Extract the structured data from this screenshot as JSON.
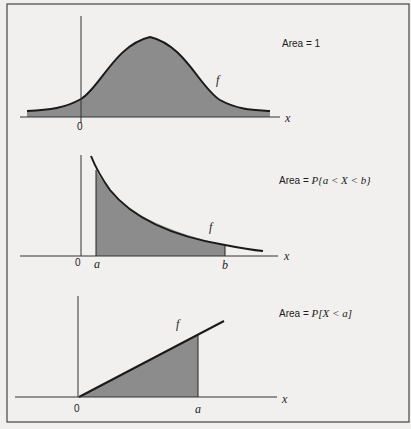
{
  "figure": {
    "colors": {
      "background": "#f1f0ee",
      "line": "#1a1a1a",
      "shade": "#8c8c8c",
      "frame": "#444444"
    },
    "panels": [
      {
        "id": "normal",
        "curve_type": "bell",
        "area_label": "Area = 1",
        "function_label": "f",
        "axis_label": "x",
        "origin_label": "0",
        "shaded_region": "entire area under curve"
      },
      {
        "id": "exponential",
        "curve_type": "decreasing",
        "area_label_prefix": "Area = ",
        "area_label_expr": "P{a < X < b}",
        "function_label": "f",
        "axis_label": "x",
        "origin_label": "0",
        "a_label": "a",
        "b_label": "b",
        "shaded_region": "between a and b"
      },
      {
        "id": "linear",
        "curve_type": "increasing line",
        "area_label_prefix": "Area = ",
        "area_label_expr": "P[X < a]",
        "function_label": "f",
        "axis_label": "x",
        "origin_label": "0",
        "a_label": "a",
        "shaded_region": "between 0 and a"
      }
    ]
  }
}
